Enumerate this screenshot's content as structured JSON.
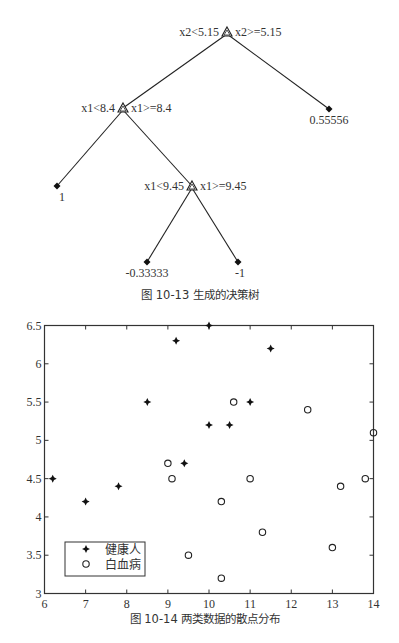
{
  "chart_data": [
    {
      "type": "tree",
      "title": "图 10-13   生成的决策树",
      "nodes": [
        {
          "id": "root",
          "kind": "split",
          "left_label": "x2<5.15",
          "right_label": "x2>=5.15",
          "x": 227,
          "y": 32
        },
        {
          "id": "n1",
          "kind": "split",
          "left_label": "x1<8.4",
          "right_label": "x1>=8.4",
          "x": 123,
          "y": 108
        },
        {
          "id": "leaf_a",
          "kind": "leaf",
          "value": "0.55556",
          "x": 329,
          "y": 109
        },
        {
          "id": "leaf_b",
          "kind": "leaf",
          "value": "1",
          "x": 57,
          "y": 186
        },
        {
          "id": "n2",
          "kind": "split",
          "left_label": "x1<9.45",
          "right_label": "x1>=9.45",
          "x": 192,
          "y": 186
        },
        {
          "id": "leaf_c",
          "kind": "leaf",
          "value": "-0.33333",
          "x": 147,
          "y": 262
        },
        {
          "id": "leaf_d",
          "kind": "leaf",
          "value": "-1",
          "x": 238,
          "y": 262
        }
      ],
      "edges": [
        [
          "root",
          "n1"
        ],
        [
          "root",
          "leaf_a"
        ],
        [
          "n1",
          "leaf_b"
        ],
        [
          "n1",
          "n2"
        ],
        [
          "n2",
          "leaf_c"
        ],
        [
          "n2",
          "leaf_d"
        ]
      ]
    },
    {
      "type": "scatter",
      "title": "图 10-14   两类数据的散点分布",
      "xlabel": "",
      "ylabel": "",
      "xlim": [
        6,
        14
      ],
      "ylim": [
        3,
        6.5
      ],
      "xticks": [
        "6",
        "7",
        "8",
        "9",
        "10",
        "11",
        "12",
        "13",
        "14"
      ],
      "yticks": [
        "3",
        "3.5",
        "4",
        "4.5",
        "5",
        "5.5",
        "6",
        "6.5"
      ],
      "grid": false,
      "legend_position": "lower left",
      "series": [
        {
          "name": "健康人",
          "marker": "star",
          "points": [
            [
              6.2,
              4.5
            ],
            [
              7,
              4.2
            ],
            [
              7.8,
              4.4
            ],
            [
              8.5,
              5.5
            ],
            [
              9.2,
              6.3
            ],
            [
              9.4,
              4.7
            ],
            [
              10,
              6.5
            ],
            [
              10,
              5.2
            ],
            [
              10.5,
              5.2
            ],
            [
              11,
              5.5
            ],
            [
              11.5,
              6.2
            ]
          ]
        },
        {
          "name": "白血病",
          "marker": "circle",
          "points": [
            [
              9,
              4.7
            ],
            [
              9.1,
              4.5
            ],
            [
              9.5,
              3.5
            ],
            [
              10.3,
              4.2
            ],
            [
              10.3,
              3.2
            ],
            [
              10.6,
              5.5
            ],
            [
              11,
              4.5
            ],
            [
              11.3,
              3.8
            ],
            [
              12.4,
              5.4
            ],
            [
              13,
              3.6
            ],
            [
              13.2,
              4.4
            ],
            [
              13.8,
              4.5
            ],
            [
              14,
              5.1
            ]
          ]
        }
      ]
    }
  ],
  "captions": {
    "tree": "图 10-13   生成的决策树",
    "scatter": "图 10-14   两类数据的散点分布"
  }
}
